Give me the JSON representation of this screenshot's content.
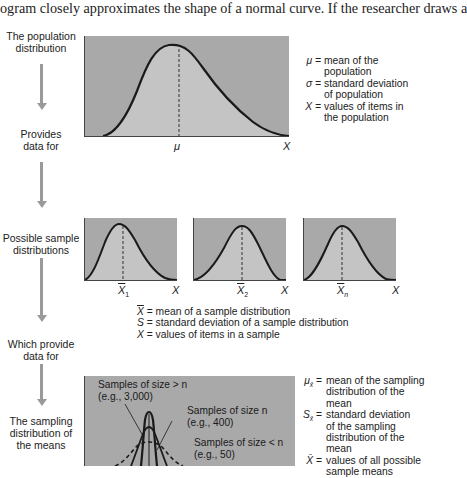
{
  "top_text": "ogram closely approximates the shape of a normal curve. If the researcher draws a",
  "flow_labels": {
    "population": [
      "The population",
      "distribution"
    ],
    "provides": [
      "Provides",
      "data for"
    ],
    "possible_samples": [
      "Possible sample",
      "distributions"
    ],
    "which_provide": [
      "Which provide",
      "data for"
    ],
    "sampling_dist": [
      "The sampling",
      "distribution of",
      "the means"
    ]
  },
  "population_panel": {
    "mean_label": "μ",
    "axis_label": "X",
    "legend": [
      {
        "symbol": "μ =",
        "text": [
          "mean of the",
          "population"
        ]
      },
      {
        "symbol": "σ =",
        "text": [
          "standard deviation",
          "of population"
        ]
      },
      {
        "symbol": "X =",
        "text": [
          "values of items in",
          "the population"
        ]
      }
    ]
  },
  "sample_panels": [
    {
      "mean_label": "X",
      "subscript": "1",
      "axis_label": "X"
    },
    {
      "mean_label": "X",
      "subscript": "2",
      "axis_label": "X"
    },
    {
      "mean_label": "X",
      "subscript": "n",
      "axis_label": "X"
    }
  ],
  "sample_legend": [
    {
      "symbol": "X",
      "overbar": true,
      "text": " = mean of a sample distribution"
    },
    {
      "symbol": "S",
      "overbar": false,
      "text": " = standard deviation of a sample distribution"
    },
    {
      "symbol": "X",
      "overbar": false,
      "text": " = values of items in a sample"
    }
  ],
  "sampling_panel": {
    "annotations": [
      {
        "line1": "Samples of size > n",
        "line2": "(e.g., 3,000)"
      },
      {
        "line1": "Samples of size n",
        "line2": "(e.g., 400)"
      },
      {
        "line1": "Samples of size < n",
        "line2": "(e.g., 50)"
      }
    ],
    "legend": [
      {
        "symbol": "μ",
        "sub": "x̄",
        "eq": "=",
        "text": [
          "mean of the sampling",
          "distribution of the mean"
        ]
      },
      {
        "symbol": "S",
        "sub": "x̄",
        "eq": "=",
        "text": [
          "standard deviation",
          "of the sampling",
          "distribution of the mean"
        ]
      },
      {
        "symbol": "X̄",
        "sub": "",
        "eq": "=",
        "text": [
          "values of all possible",
          "sample means"
        ]
      }
    ]
  },
  "colors": {
    "panel_bg": "#a9a9a9",
    "curve_fill": "#c4c4c4",
    "curve_stroke": "#1a1a1a",
    "arrow": "#9a9a9a"
  }
}
